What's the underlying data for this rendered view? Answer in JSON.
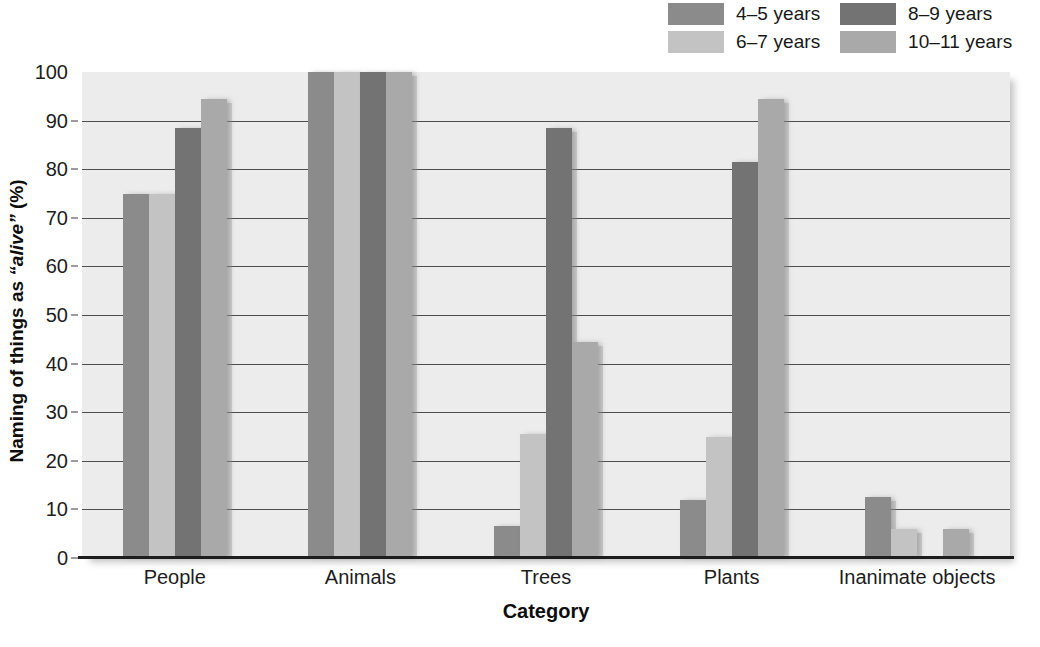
{
  "chart_data": {
    "type": "bar",
    "title": "",
    "xlabel": "Category",
    "ylabel": "Naming of things as \"alive\" (%)",
    "ylabel_plain": "Naming of things as ",
    "ylabel_italic": "“alive”",
    "ylabel_tail": " (%)",
    "categories": [
      "People",
      "Animals",
      "Trees",
      "Plants",
      "Inanimate objects"
    ],
    "series": [
      {
        "name": "4–5 years",
        "color": "#8b8b8b",
        "values": [
          75,
          100,
          6.5,
          12,
          12.5
        ]
      },
      {
        "name": "6–7 years",
        "color": "#c3c3c3",
        "values": [
          75,
          100,
          25.5,
          25,
          6
        ]
      },
      {
        "name": "8–9 years",
        "color": "#737373",
        "values": [
          88.5,
          100,
          88.5,
          81.5,
          0
        ]
      },
      {
        "name": "10–11 years",
        "color": "#a9a9a9",
        "values": [
          94.5,
          100,
          44.5,
          94.5,
          6
        ]
      }
    ],
    "ylim": [
      0,
      100
    ],
    "yticks": [
      0,
      10,
      20,
      30,
      40,
      50,
      60,
      70,
      80,
      90,
      100
    ],
    "ytick_labels": [
      "0",
      "10",
      "20",
      "30",
      "40",
      "50",
      "60",
      "70",
      "80",
      "90",
      "100"
    ],
    "grid": true,
    "grid_axis": "y",
    "legend_position": "top-right",
    "plot_background": "#ececec"
  },
  "legend": {
    "entries": [
      {
        "label": "4–5 years",
        "color": "#8b8b8b"
      },
      {
        "label": "8–9 years",
        "color": "#737373"
      },
      {
        "label": "6–7 years",
        "color": "#c3c3c3"
      },
      {
        "label": "10–11 years",
        "color": "#a9a9a9"
      }
    ]
  },
  "axes": {
    "x_title": "Category",
    "y_title_pre": "Naming of things as ",
    "y_title_em": "“alive”",
    "y_title_post": " (%)"
  }
}
